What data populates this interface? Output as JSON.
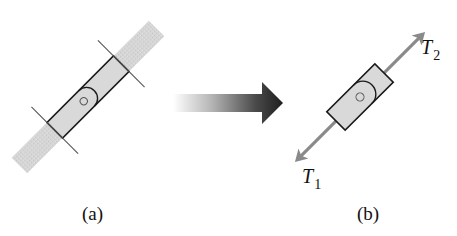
{
  "figure": {
    "panels": [
      {
        "id": "a",
        "label": "(a)",
        "description": "Belt segment with block clamped; two cut lines isolate the block"
      },
      {
        "id": "b",
        "label": "(b)",
        "description": "Free-body diagram of block with tensions"
      }
    ],
    "transition_arrow": {
      "direction": "right",
      "style": "gradient"
    },
    "forces": {
      "t2": {
        "symbol": "T",
        "subscript": "2",
        "direction": "up-right"
      },
      "t1": {
        "symbol": "T",
        "subscript": "1",
        "direction": "down-left"
      }
    },
    "colors": {
      "band": "#d2d2d2",
      "block_fill": "#d9d9d9",
      "outline": "#1a1a1a",
      "cut_line": "#555555",
      "force_arrow": "#8a8a8a",
      "arrow_dark": "#1e1e1e",
      "arrow_light": "#ffffff"
    }
  }
}
